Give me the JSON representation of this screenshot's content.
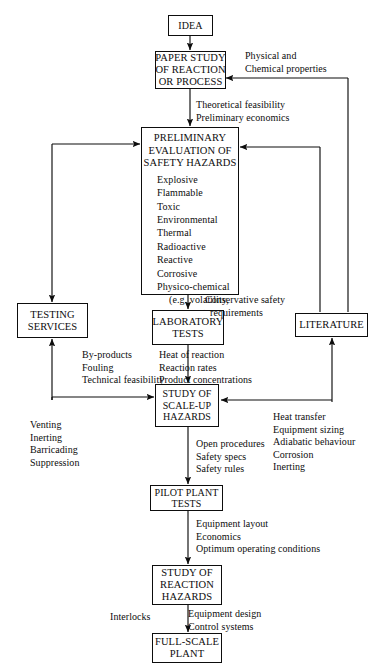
{
  "diagram": {
    "type": "flowchart",
    "stroke_color": "#0d0d0d",
    "background_color": "#ffffff",
    "nodes": [
      {
        "id": "idea",
        "lines": [
          "IDEA"
        ]
      },
      {
        "id": "paper",
        "lines": [
          "PAPER STUDY",
          "OF REACTION",
          "OR PROCESS"
        ]
      },
      {
        "id": "prelim",
        "lines": [
          "PRELIMINARY",
          "EVALUATION OF",
          "SAFETY HAZARDS"
        ],
        "hazards": [
          "Explosive",
          "Flammable",
          "Toxic",
          "Environmental",
          "Thermal",
          "Radioactive",
          "Reactive",
          "Corrosive",
          "Physico-chemical"
        ],
        "hazard_sub": [
          "(e.g. volatility,",
          "dustness)"
        ]
      },
      {
        "id": "testing",
        "lines": [
          "TESTING",
          "SERVICES"
        ]
      },
      {
        "id": "lab",
        "lines": [
          "LABORATORY",
          "TESTS"
        ]
      },
      {
        "id": "lit",
        "lines": [
          "LITERATURE"
        ]
      },
      {
        "id": "scaleup",
        "lines": [
          "STUDY OF",
          "SCALE-UP",
          "HAZARDS"
        ]
      },
      {
        "id": "pilot",
        "lines": [
          "PILOT PLANT",
          "TESTS"
        ]
      },
      {
        "id": "react",
        "lines": [
          "STUDY OF",
          "REACTION",
          "HAZARDS"
        ]
      },
      {
        "id": "full",
        "lines": [
          "FULL-SCALE",
          "PLANT"
        ]
      }
    ],
    "edge_labels": {
      "physical": "Physical and\nChemical properties",
      "theoretical": "Theoretical feasibility\nPreliminary economics",
      "conservative": "Conservative safety\n  requirements",
      "byproducts": "By-products\nFouling\nTechnical feasibility",
      "heat_reaction": "Heat of reaction\nReaction rates\nProduct concentrations",
      "venting": "Venting\nInerting\nBarricading\nSuppression",
      "open_proc": "Open procedures\nSafety specs\nSafety rules",
      "heat_transfer": "Heat transfer\nEquipment sizing\nAdiabatic behaviour\nCorrosion\nInerting",
      "equip_layout": "Equipment layout\nEconomics\nOptimum operating conditions",
      "interlocks": "Interlocks",
      "equip_design": "Equipment design\nControl systems"
    }
  }
}
